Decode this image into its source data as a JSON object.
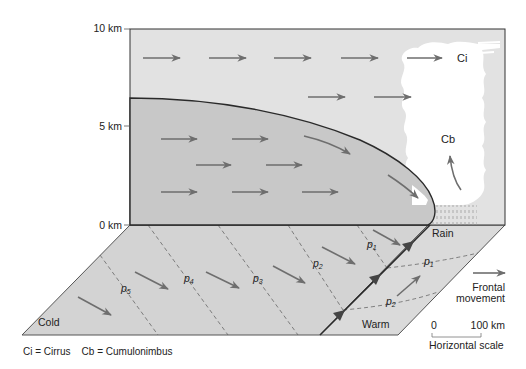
{
  "diagram": {
    "type": "cold-front-cross-section",
    "axis": {
      "ticks": [
        {
          "label": "10 km",
          "y": 29
        },
        {
          "label": "5 km",
          "y": 126
        },
        {
          "label": "0 km",
          "y": 225
        }
      ]
    },
    "clouds": {
      "ci_label": "Ci",
      "cb_label": "Cb"
    },
    "surface": {
      "rain_label": "Rain",
      "cold_label": "Cold",
      "warm_label": "Warm",
      "isobars": [
        {
          "label": "p",
          "sub": "5"
        },
        {
          "label": "p",
          "sub": "4"
        },
        {
          "label": "p",
          "sub": "3"
        },
        {
          "label": "p",
          "sub": "2"
        },
        {
          "label": "p",
          "sub": "1"
        }
      ],
      "warm_isobars": [
        {
          "label": "p",
          "sub": "1"
        },
        {
          "label": "p",
          "sub": "2"
        }
      ]
    },
    "legend": {
      "frontal_movement_line1": "Frontal",
      "frontal_movement_line2": "movement",
      "scale_start": "0",
      "scale_end": "100 km",
      "scale_caption": "Horizontal scale",
      "abbreviations": "Ci = Cirrus    Cb = Cumulonimbus"
    },
    "colors": {
      "upper_air": "#e2e2e2",
      "cold_air": "#c8c8c8",
      "ground_cold": "#d4d4d4",
      "ground_warm": "#d9d9d9",
      "cloud": "#ffffff",
      "arrow": "#6e6e6e",
      "line": "#2a2a2a"
    }
  }
}
